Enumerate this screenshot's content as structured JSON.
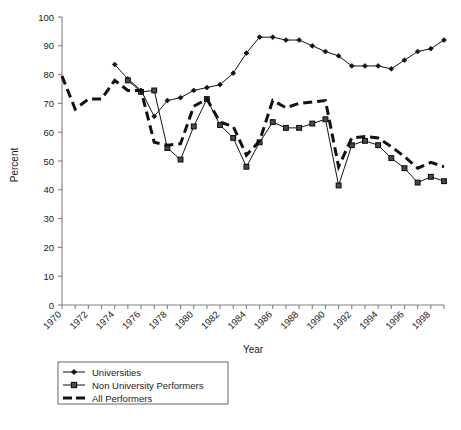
{
  "chart_data": {
    "type": "line",
    "title": "",
    "xlabel": "Year",
    "ylabel": "Percent",
    "xlim": [
      1970,
      1999
    ],
    "ylim": [
      0,
      100
    ],
    "ytick_step": 10,
    "yticks": [
      0,
      10,
      20,
      30,
      40,
      50,
      60,
      70,
      80,
      90,
      100
    ],
    "xticks": [
      1970,
      1971,
      1972,
      1973,
      1974,
      1975,
      1976,
      1977,
      1978,
      1979,
      1980,
      1981,
      1982,
      1983,
      1984,
      1985,
      1986,
      1987,
      1988,
      1989,
      1990,
      1991,
      1992,
      1993,
      1994,
      1995,
      1996,
      1997,
      1998,
      1999
    ],
    "xtick_labels": [
      "1970",
      "1972",
      "1974",
      "1976",
      "1978",
      "1980",
      "1982",
      "1984",
      "1986",
      "1988",
      "1990",
      "1992",
      "1994",
      "1996",
      "1998"
    ],
    "xtick_label_values": [
      1970,
      1972,
      1974,
      1976,
      1978,
      1980,
      1982,
      1984,
      1986,
      1988,
      1990,
      1992,
      1994,
      1996,
      1998
    ],
    "grid": false,
    "legend_position": "below-left",
    "series": [
      {
        "name": "Universities",
        "marker": "diamond",
        "linestyle": "solid",
        "x": [
          1974,
          1975,
          1976,
          1977,
          1978,
          1979,
          1980,
          1981,
          1982,
          1983,
          1984,
          1985,
          1986,
          1987,
          1988,
          1989,
          1990,
          1991,
          1992,
          1993,
          1994,
          1995,
          1996,
          1997,
          1998,
          1999
        ],
        "values": [
          83.5,
          78.5,
          74.5,
          65.5,
          71.0,
          72.0,
          74.5,
          75.5,
          76.5,
          80.5,
          87.5,
          93.0,
          93.0,
          92.0,
          92.0,
          90.0,
          88.0,
          86.5,
          83.0,
          83.0,
          83.0,
          82.0,
          85.0,
          88.0,
          89.0,
          92.0
        ]
      },
      {
        "name": "Non University Performers",
        "marker": "square",
        "linestyle": "solid",
        "x": [
          1975,
          1976,
          1977,
          1978,
          1979,
          1980,
          1981,
          1982,
          1983,
          1984,
          1985,
          1986,
          1987,
          1988,
          1989,
          1990,
          1991,
          1992,
          1993,
          1994,
          1995,
          1996,
          1997,
          1998,
          1999
        ],
        "values": [
          78.0,
          74.0,
          74.5,
          54.5,
          50.5,
          62.0,
          71.5,
          62.5,
          58.0,
          48.0,
          56.5,
          63.5,
          61.5,
          61.5,
          63.0,
          64.5,
          41.5,
          55.5,
          57.0,
          55.5,
          51.0,
          47.5,
          42.5,
          44.5,
          43.0
        ]
      },
      {
        "name": "All Performers",
        "marker": "none",
        "linestyle": "thick-dashed",
        "x": [
          1970,
          1971,
          1972,
          1973,
          1974,
          1975,
          1976,
          1977,
          1978,
          1979,
          1980,
          1981,
          1982,
          1983,
          1984,
          1985,
          1986,
          1987,
          1988,
          1989,
          1990,
          1991,
          1992,
          1993,
          1994,
          1995,
          1996,
          1997,
          1998,
          1999
        ],
        "values": [
          79.5,
          68.0,
          71.5,
          71.5,
          78.0,
          74.5,
          74.5,
          56.5,
          55.5,
          56.0,
          69.0,
          71.5,
          63.5,
          62.0,
          52.0,
          57.0,
          71.0,
          68.5,
          70.0,
          70.5,
          71.0,
          48.0,
          58.0,
          58.5,
          58.0,
          55.0,
          51.5,
          47.5,
          49.5,
          48.0
        ]
      }
    ]
  },
  "legend": {
    "items": [
      {
        "label": "Universities"
      },
      {
        "label": "Non University Performers"
      },
      {
        "label": "All Performers"
      }
    ]
  },
  "axis": {
    "ylabel": "Percent",
    "xlabel": "Year"
  },
  "caption": {
    "text": ""
  }
}
